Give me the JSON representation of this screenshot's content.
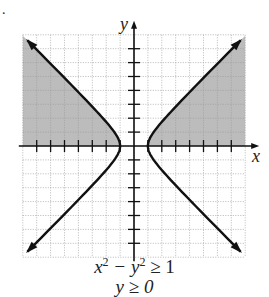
{
  "bullet": ".",
  "chart_data": {
    "type": "region",
    "title": "",
    "xlabel": "x",
    "ylabel": "y",
    "xlim": [
      -8,
      8
    ],
    "ylim": [
      -8,
      8
    ],
    "grid": true,
    "tick_labels": false,
    "curve": "hyperbola x^2 - y^2 = 1",
    "vertices": [
      [
        -1,
        0
      ],
      [
        1,
        0
      ]
    ],
    "asymptotes": [
      "y = x",
      "y = -x"
    ],
    "shaded_region": "x^2 - y^2 >= 1 and y >= 0",
    "shade_color": "#b0b0b0",
    "inequalities": [
      "x^2 - y^2 ≥ 1",
      "y ≥ 0"
    ]
  },
  "caption": {
    "line1": {
      "x": "x",
      "minus_y": " − y",
      "rhs": " ≥ 1",
      "exp": "2"
    },
    "line2": "y ≥ 0"
  },
  "axes": {
    "x_label": "x",
    "y_label": "y"
  }
}
